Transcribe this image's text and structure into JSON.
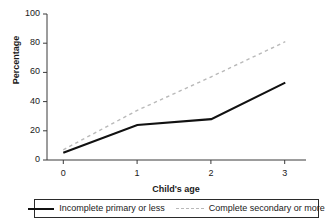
{
  "chart_data": {
    "type": "line",
    "title": "",
    "xlabel": "Child's age",
    "ylabel": "Percentage",
    "x": [
      0,
      1,
      2,
      3
    ],
    "xticklabels": [
      "0",
      "1",
      "2",
      "3"
    ],
    "yticklabels": [
      "0",
      "20",
      "40",
      "60",
      "80",
      "100"
    ],
    "yticks": [
      0,
      20,
      40,
      60,
      80,
      100
    ],
    "xlim": [
      -0.22,
      3.28
    ],
    "ylim": [
      0,
      100
    ],
    "grid": false,
    "legend_position": "bottom",
    "series": [
      {
        "name": "Incomplete primary or less",
        "values": [
          5,
          24,
          28,
          53
        ],
        "style": "solid",
        "color": "#111111"
      },
      {
        "name": "Complete secondary or more",
        "values": [
          7,
          34,
          57,
          81
        ],
        "style": "dashed",
        "color": "#b9b9b9"
      }
    ]
  },
  "axes": {
    "y_title": "Percentage",
    "x_title": "Child's age",
    "y_labels": [
      "100",
      "80",
      "60",
      "40",
      "20",
      "0"
    ],
    "x_labels": [
      "0",
      "1",
      "2",
      "3"
    ]
  },
  "legend": {
    "entries": [
      {
        "label": "Incomplete primary or less",
        "swatch": "solid-line-swatch"
      },
      {
        "label": "Complete secondary or more",
        "swatch": "dashed-line-swatch"
      }
    ]
  }
}
